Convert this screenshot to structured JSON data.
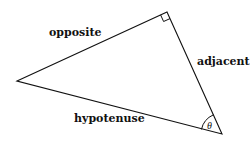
{
  "diagram": {
    "type": "right-triangle",
    "labels": {
      "opposite": "opposite",
      "adjacent": "adjacent",
      "hypotenuse": "hypotenuse",
      "angle": "θ"
    },
    "vertices": {
      "left": [
        17,
        81
      ],
      "right_angle": [
        167,
        12
      ],
      "theta_vertex": [
        222,
        134
      ]
    },
    "stroke_color": "#111111"
  }
}
